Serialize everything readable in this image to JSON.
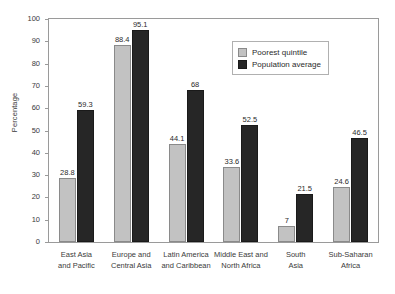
{
  "chart_data": {
    "type": "bar",
    "title": "",
    "xlabel": "",
    "ylabel": "Percentage",
    "ylim": [
      0,
      100
    ],
    "ytick_step": 10,
    "yticks": [
      100,
      90,
      80,
      70,
      60,
      50,
      40,
      30,
      20,
      10,
      0
    ],
    "grid": false,
    "legend_position": "top-right",
    "categories": [
      "East Asia and Pacific",
      "Europe and Central Asia",
      "Latin America and Caribbean",
      "Middle East and North Africa",
      "South Asia",
      "Sub-Saharan Africa"
    ],
    "category_lines": [
      [
        "East Asia",
        "and Pacific"
      ],
      [
        "Europe and",
        "Central Asia"
      ],
      [
        "Latin America",
        "and Caribbean"
      ],
      [
        "Middle East and",
        "North Africa"
      ],
      [
        "South",
        "Asia"
      ],
      [
        "Sub-Saharan",
        "Africa"
      ]
    ],
    "series": [
      {
        "name": "Poorest quintile",
        "color": "#c2c2c2",
        "values": [
          28.8,
          88.4,
          44.1,
          33.6,
          7,
          24.6
        ],
        "labels": [
          "28.8",
          "88.4",
          "44.1",
          "33.6",
          "7",
          "24.6"
        ]
      },
      {
        "name": "Population average",
        "color": "#262626",
        "values": [
          59.3,
          95.1,
          68,
          52.5,
          21.5,
          46.5
        ],
        "labels": [
          "59.3",
          "95.1",
          "68",
          "52.5",
          "21.5",
          "46.5"
        ]
      }
    ]
  }
}
